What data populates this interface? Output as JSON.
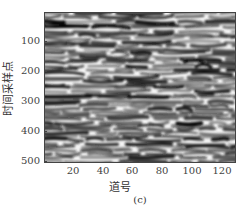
{
  "chart_data": {
    "type": "heatmap",
    "title": "",
    "subtitle": "(c)",
    "xlabel": "道号",
    "ylabel": "时间采样点",
    "x_ticks": [
      20,
      40,
      60,
      80,
      100,
      120
    ],
    "y_ticks": [
      100,
      200,
      300,
      400,
      500
    ],
    "xlim": [
      1,
      128
    ],
    "ylim": [
      1,
      512
    ],
    "y_inverted": true,
    "colormap": "gray",
    "grid": false,
    "legend": null
  },
  "figure": {
    "caption": "(c)",
    "xlabel": "道号",
    "ylabel": "时间采样点",
    "y_tick_labels": [
      "100",
      "200",
      "300",
      "400",
      "500"
    ],
    "x_tick_labels": [
      "20",
      "40",
      "60",
      "80",
      "100",
      "120"
    ]
  }
}
